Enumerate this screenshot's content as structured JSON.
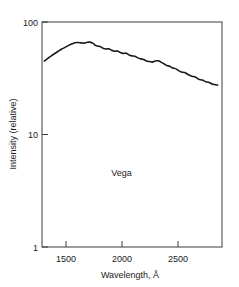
{
  "chart_data": {
    "type": "line",
    "title": "",
    "subtitle": "",
    "xlabel": "Wavelength, Å",
    "ylabel": "Intensity (relative)",
    "xlim": [
      1300,
      2850
    ],
    "ylim": [
      1,
      100
    ],
    "yscale": "log",
    "xscale": "linear",
    "grid": false,
    "legend": null,
    "legend_position": "none",
    "xticks": [
      1500,
      2000,
      2500
    ],
    "xtick_labels": [
      "1500",
      "2000",
      "2500"
    ],
    "yticks": [
      1,
      10,
      100
    ],
    "ytick_labels": [
      "1",
      "10",
      "100"
    ],
    "annotations": [
      {
        "text": "Vega",
        "x": 1985,
        "y": 4.3
      }
    ],
    "series": [
      {
        "name": "Vega",
        "color": "#1a1a1a",
        "x": [
          1320,
          1350,
          1380,
          1410,
          1440,
          1470,
          1500,
          1530,
          1560,
          1585,
          1610,
          1640,
          1665,
          1690,
          1715,
          1740,
          1760,
          1780,
          1800,
          1825,
          1850,
          1875,
          1900,
          1925,
          1950,
          1975,
          2000,
          2025,
          2050,
          2075,
          2100,
          2125,
          2150,
          2175,
          2200,
          2225,
          2250,
          2275,
          2300,
          2325,
          2350,
          2375,
          2400,
          2425,
          2450,
          2475,
          2500,
          2530,
          2560,
          2590,
          2620,
          2650,
          2680,
          2710,
          2740,
          2770,
          2812
        ],
        "y": [
          45.0,
          47.5,
          50.0,
          52.5,
          55.0,
          57.5,
          59.5,
          62.0,
          64.0,
          65.5,
          65.8,
          65.2,
          65.0,
          66.0,
          66.2,
          64.5,
          62.0,
          61.0,
          60.5,
          58.5,
          57.5,
          57.8,
          56.0,
          55.0,
          55.2,
          53.5,
          52.5,
          52.8,
          51.0,
          50.0,
          49.5,
          48.0,
          47.0,
          46.5,
          45.0,
          44.5,
          44.0,
          45.0,
          45.2,
          44.0,
          42.5,
          41.0,
          40.5,
          39.0,
          38.5,
          37.0,
          36.0,
          35.5,
          34.0,
          33.0,
          32.5,
          31.0,
          30.5,
          29.5,
          29.0,
          28.0,
          27.5
        ]
      }
    ]
  },
  "axes": {
    "x_axis_title": "Wavelength, Å",
    "y_axis_title": "Intensity (relative)"
  },
  "colors": {
    "curve": "#1a1a1a",
    "frame": "#3a3a3a",
    "background": "#ffffff",
    "text": "#1a1a1a"
  }
}
